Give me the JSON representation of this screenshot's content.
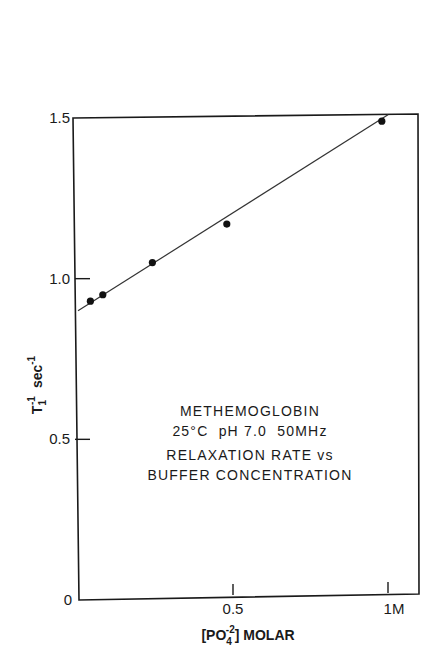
{
  "chart_data": {
    "type": "scatter",
    "title": "",
    "annotation": [
      "METHEMOGLOBIN",
      "25°C  pH 7.0  50MHz",
      "RELAXATION RATE vs",
      "BUFFER CONCENTRATION"
    ],
    "xlabel": "[PO4^-2] MOLAR",
    "xlabel_parts": {
      "open": "[PO",
      "sub": "4",
      "sup": "-2",
      "close": "] MOLAR"
    },
    "ylabel": "T1^-1 sec^-1",
    "ylabel_parts": {
      "base": "T",
      "sub": "1",
      "sup": "-1",
      "unit": "sec",
      "unit_sup": "-1"
    },
    "xlim": [
      0,
      1.05
    ],
    "ylim": [
      0,
      1.5
    ],
    "grid": false,
    "x_ticks": [
      {
        "value": 0,
        "label": "0"
      },
      {
        "value": 0.5,
        "label": "0.5"
      },
      {
        "value": 1.0,
        "label": "1M"
      }
    ],
    "y_ticks": [
      {
        "value": 0,
        "label": "0"
      },
      {
        "value": 0.5,
        "label": "0.5"
      },
      {
        "value": 1.0,
        "label": "1.0"
      },
      {
        "value": 1.5,
        "label": "1.5"
      }
    ],
    "series": [
      {
        "name": "measured",
        "points": [
          {
            "x": 0.04,
            "y": 0.93
          },
          {
            "x": 0.08,
            "y": 0.95
          },
          {
            "x": 0.24,
            "y": 1.05
          },
          {
            "x": 0.48,
            "y": 1.17
          },
          {
            "x": 0.98,
            "y": 1.49
          }
        ]
      }
    ],
    "fit_line": {
      "x0": 0,
      "y0": 0.9,
      "x1": 1.0,
      "y1": 1.51
    }
  }
}
